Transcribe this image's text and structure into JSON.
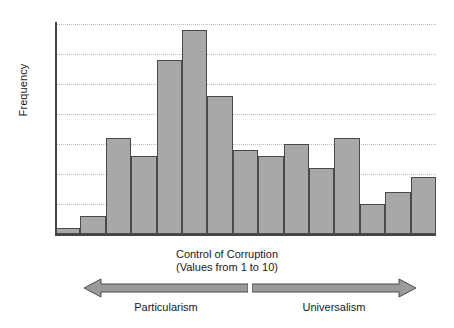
{
  "chart_data": {
    "type": "bar",
    "title": "",
    "subtitle": "",
    "xlabel": "Control of Corruption",
    "xlabel_sub": "(Values from 1 to 10)",
    "ylabel": "Frequency",
    "ylim": [
      0,
      35
    ],
    "ytick_step": 5,
    "yticks": [
      0,
      5,
      10,
      15,
      20,
      25,
      30,
      35
    ],
    "ytick_labels": [
      "0",
      "5",
      "10",
      "15",
      "20",
      "25",
      "30",
      "35"
    ],
    "grid": true,
    "grid_axis": "y",
    "grid_style": "dotted",
    "legend": "none",
    "bar_count": 15,
    "bar_gap": 0,
    "categories": [
      "1",
      "2",
      "3",
      "4",
      "5",
      "6",
      "7",
      "8",
      "9",
      "10",
      "11",
      "12",
      "13",
      "14",
      "15"
    ],
    "values": [
      1,
      3,
      16,
      13,
      29,
      34,
      23,
      14,
      13,
      15,
      11,
      16,
      5,
      7,
      9.5
    ],
    "bar_fill_color": "#a8a8a8",
    "bar_edge_color": "#4a4a4a",
    "axis_color": "#454545",
    "gridline_color": "#c9b7b7",
    "background_color": "#ffffff"
  },
  "annotations": {
    "left_arrow_label": "Particularism",
    "right_arrow_label": "Universalism",
    "left_arrow_direction": "left",
    "right_arrow_direction": "right",
    "arrow_fill_color": "#9a9a9a",
    "arrow_edge_color": "#4a4a4a"
  }
}
